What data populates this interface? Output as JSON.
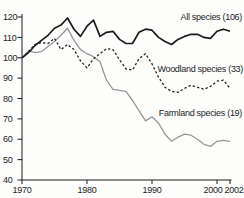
{
  "chart_data": {
    "type": "line",
    "title": "",
    "xlabel": "",
    "ylabel": "",
    "xlim": [
      1970,
      2002
    ],
    "ylim": [
      40,
      120
    ],
    "x_ticks": [
      1970,
      1980,
      1990,
      2000,
      2002
    ],
    "y_ticks": [
      40,
      50,
      60,
      70,
      80,
      90,
      100,
      110,
      120
    ],
    "grid": "off",
    "legend_position": "inline-right",
    "axis_color": "#1c1c1c",
    "text_color": "#1c1c1c",
    "years": [
      1970,
      1971,
      1972,
      1973,
      1974,
      1975,
      1976,
      1977,
      1978,
      1979,
      1980,
      1981,
      1982,
      1983,
      1984,
      1985,
      1986,
      1987,
      1988,
      1989,
      1990,
      1991,
      1992,
      1993,
      1994,
      1995,
      1996,
      1997,
      1998,
      1999,
      2000,
      2001,
      2002
    ],
    "series": [
      {
        "name": "Farmland species (19)",
        "color": "#979797",
        "line_style": "solid",
        "line_width": 1.3,
        "values": [
          100,
          103.5,
          102.5,
          103,
          105.5,
          108,
          111,
          114.5,
          108.5,
          104,
          102,
          100.5,
          98,
          89,
          84.5,
          84,
          83.5,
          79,
          74,
          69,
          71,
          68,
          62.5,
          59,
          61,
          62.5,
          62,
          60,
          57.5,
          56.5,
          59,
          59.5,
          59
        ]
      },
      {
        "name": "Woodland species (33)",
        "color": "#252525",
        "line_style": "dashed",
        "line_width": 1.3,
        "values": [
          100,
          103,
          106.5,
          107.5,
          107,
          109.5,
          104,
          106.5,
          104,
          98.5,
          95,
          99.5,
          102,
          104.5,
          104,
          99,
          94.5,
          94,
          99.5,
          102,
          97,
          90.5,
          85.5,
          83.5,
          83,
          85,
          86.5,
          85.5,
          84.5,
          86,
          88.5,
          89,
          85
        ]
      },
      {
        "name": "All species (106)",
        "color": "#1c1c1c",
        "line_style": "solid",
        "line_width": 1.7,
        "values": [
          100,
          102.5,
          106,
          108.5,
          111,
          114.5,
          116,
          119.5,
          114,
          110.5,
          115.5,
          118.5,
          110.5,
          112.5,
          113,
          109,
          107,
          107,
          112.5,
          114,
          113.5,
          110,
          108,
          106.5,
          109,
          110.5,
          111.5,
          111.5,
          110,
          109.5,
          113,
          114,
          113
        ]
      }
    ]
  }
}
